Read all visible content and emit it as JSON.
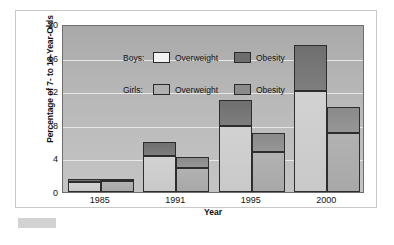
{
  "chart_data": {
    "type": "bar",
    "subtype": "grouped-stacked-bar",
    "title": "",
    "xlabel": "Year",
    "ylabel": "Percentage of 7- to 18-Year-Olds",
    "categories": [
      "1985",
      "1991",
      "1995",
      "2000"
    ],
    "ylim": [
      0,
      20
    ],
    "yticks": [
      0,
      4,
      8,
      12,
      16,
      20
    ],
    "ytick_labels": [
      "0",
      "4",
      "8",
      "12",
      "16",
      "20"
    ],
    "grid": true,
    "grid_axis": "y",
    "legend_position": "inside-top-left",
    "series": [
      {
        "name": "Boys: Overweight",
        "group": "Boys",
        "stack": "boys",
        "segment": "Overweight",
        "color": "#d2d2d2",
        "values": [
          1.2,
          4.3,
          7.8,
          12.0
        ]
      },
      {
        "name": "Boys: Obesity",
        "group": "Boys",
        "stack": "boys",
        "segment": "Obesity",
        "color": "#6f6f6f",
        "values": [
          0.3,
          1.7,
          3.2,
          5.5
        ]
      },
      {
        "name": "Girls: Overweight",
        "group": "Girls",
        "stack": "girls",
        "segment": "Overweight",
        "color": "#b2b2b2",
        "values": [
          1.3,
          2.8,
          4.8,
          7.0
        ]
      },
      {
        "name": "Girls: Obesity",
        "group": "Girls",
        "stack": "girls",
        "segment": "Obesity",
        "color": "#8a8a8a",
        "values": [
          0.2,
          1.4,
          2.2,
          3.1
        ]
      }
    ],
    "stack_totals": {
      "Boys": [
        1.5,
        6.0,
        11.0,
        17.5
      ],
      "Girls": [
        1.5,
        4.2,
        7.0,
        10.1
      ]
    }
  },
  "legend": {
    "rows": [
      {
        "group_label": "Boys:",
        "entries": [
          {
            "label": "Overweight",
            "swatch": "boys-overweight-swatch"
          },
          {
            "label": "Obesity",
            "swatch": "boys-obesity-swatch"
          }
        ]
      },
      {
        "group_label": "Girls:",
        "entries": [
          {
            "label": "Overweight",
            "swatch": "girls-overweight-swatch"
          },
          {
            "label": "Obesity",
            "swatch": "girls-obesity-swatch"
          }
        ]
      }
    ]
  }
}
